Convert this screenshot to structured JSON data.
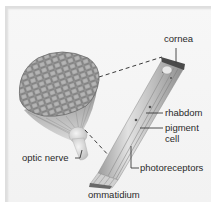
{
  "diagram": {
    "labels": {
      "cornea": "cornea",
      "rhabdom": "rhabdom",
      "pigment_cell_line1": "pigment",
      "pigment_cell_line2": "cell",
      "photoreceptors": "photoreceptors",
      "optic_nerve": "optic nerve",
      "ommatidium": "ommatidium"
    },
    "colors": {
      "background": "#f4f4f4",
      "label_text": "#2a2a2a",
      "leader_line": "#3a3a3a",
      "eye_facets": "#8a8a8a",
      "ommatidium_body": "#c8c8c8"
    }
  }
}
